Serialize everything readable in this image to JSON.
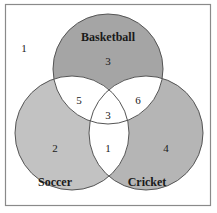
{
  "diagram": {
    "type": "venn",
    "universe_count": 1,
    "sets": [
      {
        "name": "Basketball",
        "color": "#a5a5a5"
      },
      {
        "name": "Soccer",
        "color": "#c2c2c2"
      },
      {
        "name": "Cricket",
        "color": "#b5b5b5"
      }
    ],
    "regions": {
      "basketball_only": "3",
      "soccer_only": "2",
      "cricket_only": "4",
      "basketball_soccer": "5",
      "basketball_cricket": "6",
      "soccer_cricket": "1",
      "all_three": "3",
      "outside": "1"
    },
    "intersection_fill": "#ffffff",
    "stroke_color": "#555555"
  }
}
